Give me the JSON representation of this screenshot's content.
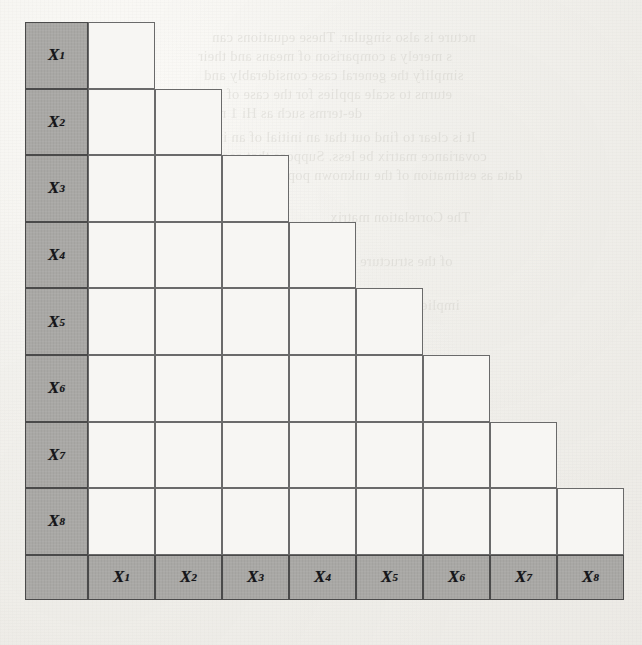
{
  "figure": {
    "kind": "lower-triangular-matrix-grid",
    "variables": [
      "X1",
      "X2",
      "X3",
      "X4",
      "X5",
      "X6",
      "X7",
      "X8"
    ],
    "row_headers": [
      {
        "var": "X",
        "sub": "1"
      },
      {
        "var": "X",
        "sub": "2"
      },
      {
        "var": "X",
        "sub": "3"
      },
      {
        "var": "X",
        "sub": "4"
      },
      {
        "var": "X",
        "sub": "5"
      },
      {
        "var": "X",
        "sub": "6"
      },
      {
        "var": "X",
        "sub": "7"
      },
      {
        "var": "X",
        "sub": "8"
      }
    ],
    "column_headers": [
      {
        "var": "X",
        "sub": "1"
      },
      {
        "var": "X",
        "sub": "2"
      },
      {
        "var": "X",
        "sub": "3"
      },
      {
        "var": "X",
        "sub": "4"
      },
      {
        "var": "X",
        "sub": "5"
      },
      {
        "var": "X",
        "sub": "6"
      },
      {
        "var": "X",
        "sub": "7"
      },
      {
        "var": "X",
        "sub": "8"
      }
    ],
    "corner_cell_label": "",
    "row_cell_counts": [
      1,
      2,
      3,
      4,
      5,
      6,
      7,
      8
    ],
    "geometry": {
      "cell_width": 67,
      "cell_height": 66.6,
      "rows": 8,
      "cols": 8,
      "header_col_width": 63,
      "header_row_height": 45
    },
    "colors": {
      "header_fill": "#a9a8a5",
      "body_fill": "#f7f6f3",
      "rule": "#5d5d5d",
      "label_text": "#15151a",
      "paper": "#f2f1ed"
    }
  },
  "bleed_text": {
    "lines": [
      {
        "text": "ncture is also singular. These equations can",
        "x": 212,
        "y": 28
      },
      {
        "text": "s merely a comparison of means and their",
        "x": 198,
        "y": 47
      },
      {
        "text": "simplify the general case considerably and",
        "x": 204,
        "y": 66
      },
      {
        "text": "eturns to scale applies for the case of two",
        "x": 200,
        "y": 85
      },
      {
        "text": "de-terms such as Hi 1 mil",
        "x": 206,
        "y": 104
      },
      {
        "text": "It is clear to find out that an initial of an inner",
        "x": 196,
        "y": 128
      },
      {
        "text": "covariance matrix be less. Suppose that each of",
        "x": 198,
        "y": 147
      },
      {
        "text": "data as estimation of the unknown population variable",
        "x": 192,
        "y": 166
      },
      {
        "text": "The Correlation matrix",
        "x": 330,
        "y": 208
      },
      {
        "text": "of the structure",
        "x": 360,
        "y": 252
      },
      {
        "text": "implied covariance matrix",
        "x": 300,
        "y": 296
      },
      {
        "text": "Example 4.1 A Numerical Example for a MODEL",
        "x": 214,
        "y": 432
      },
      {
        "text": "and the matrix of factor loadings is given as",
        "x": 222,
        "y": 455
      },
      {
        "text": "follows:",
        "x": 330,
        "y": 478
      }
    ]
  }
}
